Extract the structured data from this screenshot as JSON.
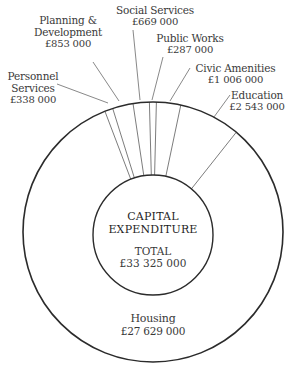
{
  "chart_data": {
    "type": "pie",
    "style": "donut",
    "title": "CAPITAL EXPENDITURE",
    "total_label": "TOTAL",
    "total_value": "£33 325 000",
    "total": 33325000,
    "currency": "GBP",
    "categories": [
      "Personnel Services",
      "Planning & Development",
      "Social Services",
      "Public Works",
      "Civic Amenities",
      "Education",
      "Housing"
    ],
    "values": [
      338000,
      853000,
      669000,
      287000,
      1006000,
      2543000,
      27629000
    ],
    "value_labels": [
      "£338 000",
      "£853 000",
      "£669 000",
      "£287 000",
      "£1 006 000",
      "£2 543 000",
      "£27 629 000"
    ],
    "start_angle_deg": -21.7,
    "direction": "clockwise",
    "legend": "none (direct labels with leader lines)"
  },
  "labels": {
    "personnel": {
      "line1": "Personnel",
      "line2": "Services",
      "value": "£338 000"
    },
    "planning": {
      "line1": "Planning &",
      "line2": "Development",
      "value": "£853 000"
    },
    "social": {
      "line1": "Social Services",
      "value": "£669 000"
    },
    "public": {
      "line1": "Public Works",
      "value": "£287 000"
    },
    "civic": {
      "line1": "Civic Amenities",
      "value": "£1 006 000"
    },
    "education": {
      "line1": "Education",
      "value": "£2 543 000"
    },
    "housing": {
      "line1": "Housing",
      "value": "£27 629 000"
    }
  },
  "center": {
    "title_line1": "CAPITAL",
    "title_line2": "EXPENDITURE",
    "total_label": "TOTAL",
    "total_value": "£33 325 000"
  },
  "colors": {
    "stroke": "#2b2b2b",
    "divider": "#5a5a5a",
    "leader": "#6a6a6a",
    "text": "#3a3a3a",
    "background": "#ffffff"
  }
}
